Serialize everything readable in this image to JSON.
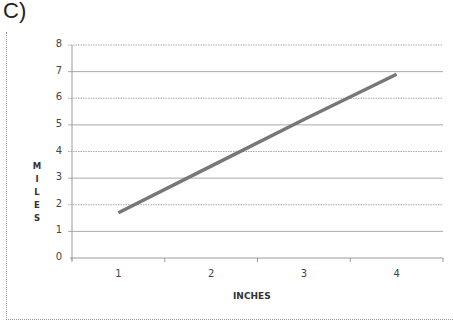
{
  "panel_label": "C)",
  "chart_data": {
    "type": "line",
    "title": "",
    "xlabel": "INCHES",
    "ylabel": "MILES",
    "categories": [
      "1",
      "2",
      "3",
      "4"
    ],
    "x": [
      1,
      2,
      3,
      4
    ],
    "series": [
      {
        "name": "Miles",
        "values": [
          1.7,
          3.45,
          5.2,
          6.9
        ],
        "color": "#777777"
      }
    ],
    "ylim": [
      0,
      8
    ],
    "yticks": [
      0,
      1,
      2,
      3,
      4,
      5,
      6,
      7,
      8
    ],
    "grid": true,
    "legend": "none"
  },
  "axis": {
    "y_title_letters": [
      "M",
      "I",
      "L",
      "E",
      "S"
    ],
    "y_tick_labels": [
      "0",
      "1",
      "2",
      "3",
      "4",
      "5",
      "6",
      "7",
      "8"
    ],
    "x_tick_labels": [
      "1",
      "2",
      "3",
      "4"
    ]
  }
}
